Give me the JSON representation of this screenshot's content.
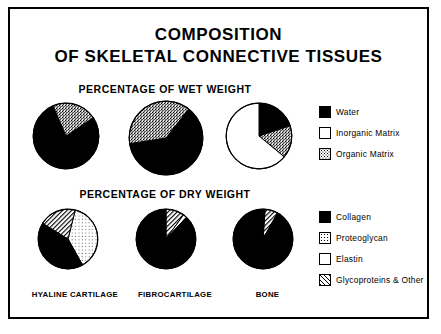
{
  "figure": {
    "title_lines": [
      "COMPOSITION",
      "OF SKELETAL CONNECTIVE TISSUES"
    ],
    "sections": [
      {
        "id": "wet",
        "header": "PERCENTAGE OF WET WEIGHT"
      },
      {
        "id": "dry",
        "header": "PERCENTAGE OF DRY WEIGHT"
      }
    ],
    "category_labels": [
      "HYALINE CARTILAGE",
      "FIBROCARTILAGE",
      "BONE"
    ],
    "legends": [
      {
        "id": "wet-legend",
        "items": [
          {
            "label": "Water",
            "pattern": "solid-black",
            "color": "#000000"
          },
          {
            "label": "Inorganic Matrix",
            "pattern": "white",
            "color": "#ffffff"
          },
          {
            "label": "Organic Matrix",
            "pattern": "dense-stipple",
            "color": "#808080"
          }
        ]
      },
      {
        "id": "dry-legend",
        "items": [
          {
            "label": "Collagen",
            "pattern": "solid-black",
            "color": "#000000"
          },
          {
            "label": "Proteoglycan",
            "pattern": "light-stipple",
            "color": "#d9d9d9"
          },
          {
            "label": "Elastin",
            "pattern": "white",
            "color": "#ffffff"
          },
          {
            "label": "Glycoproteins & Other",
            "pattern": "diagonal-hatch",
            "color": "#9a9a9a"
          }
        ]
      }
    ]
  },
  "chart_data": [
    {
      "type": "pie",
      "title": "Hyaline Cartilage - Percentage of Wet Weight",
      "categories": [
        "Water",
        "Organic Matrix"
      ],
      "values": [
        78,
        22
      ],
      "patterns": [
        "solid-black",
        "dense-stipple"
      ],
      "start_angle": -34,
      "units": "percent"
    },
    {
      "type": "pie",
      "title": "Fibrocartilage - Percentage of Wet Weight",
      "categories": [
        "Water",
        "Organic Matrix"
      ],
      "values": [
        62,
        38
      ],
      "patterns": [
        "solid-black",
        "dense-stipple"
      ],
      "start_angle": -52,
      "units": "percent"
    },
    {
      "type": "pie",
      "title": "Bone - Percentage of Wet Weight",
      "categories": [
        "Water",
        "Organic Matrix",
        "Inorganic Matrix"
      ],
      "values": [
        20,
        16,
        64
      ],
      "patterns": [
        "solid-black",
        "dense-stipple",
        "white"
      ],
      "start_angle": -90,
      "units": "percent"
    },
    {
      "type": "pie",
      "title": "Hyaline Cartilage - Percentage of Dry Weight",
      "categories": [
        "Proteoglycan",
        "Collagen",
        "Glycoproteins & Other"
      ],
      "values": [
        38,
        42,
        20
      ],
      "patterns": [
        "light-stipple",
        "solid-black",
        "diagonal-hatch"
      ],
      "start_angle": -76,
      "units": "percent"
    },
    {
      "type": "pie",
      "title": "Fibrocartilage - Percentage of Dry Weight",
      "categories": [
        "Glycoproteins & Other",
        "Elastin",
        "Collagen"
      ],
      "values": [
        10,
        2,
        88
      ],
      "patterns": [
        "diagonal-hatch",
        "white",
        "solid-black"
      ],
      "start_angle": -90,
      "units": "percent"
    },
    {
      "type": "pie",
      "title": "Bone - Percentage of Dry Weight",
      "categories": [
        "Glycoproteins & Other",
        "Collagen"
      ],
      "values": [
        7,
        93
      ],
      "patterns": [
        "diagonal-hatch",
        "solid-black"
      ],
      "start_angle": -86,
      "units": "percent"
    }
  ]
}
